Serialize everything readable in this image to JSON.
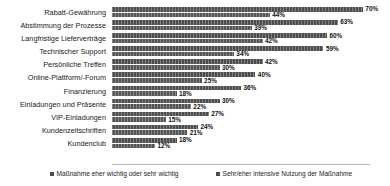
{
  "chart_data": {
    "type": "bar",
    "orientation": "horizontal",
    "title": "",
    "xlabel": "",
    "ylabel": "",
    "xlim": [
      0,
      72
    ],
    "grid": false,
    "legend_position": "bottom",
    "categories": [
      "Rabatt-Gewährung",
      "Abstimmung der Prozesse",
      "Langfristige Lieferverträge",
      "Technischer Support",
      "Persönliche Treffen",
      "Online-Plattform/-Forum",
      "Finanzierung",
      "Einladungen und Präsente",
      "VIP-Einladungen",
      "Kundenzeitschriften",
      "Kundenclub"
    ],
    "series": [
      {
        "name": "Maßnahme eher wichtig oder sehr wichtig",
        "color": "#4d4d4d",
        "values": [
          70,
          63,
          60,
          59,
          42,
          40,
          36,
          30,
          27,
          24,
          18
        ],
        "labels": [
          "70%",
          "63%",
          "60%",
          "59%",
          "42%",
          "40%",
          "36%",
          "30%",
          "27%",
          "24%",
          "18%"
        ]
      },
      {
        "name": "Sehr/eher intensive Nutzung der Maßnahme",
        "color": "#555555",
        "values": [
          44,
          39,
          42,
          34,
          30,
          25,
          18,
          22,
          15,
          21,
          12
        ],
        "labels": [
          "44%",
          "39%",
          "42%",
          "34%",
          "30%",
          "25%",
          "18%",
          "22%",
          "15%",
          "21%",
          "12%"
        ]
      }
    ]
  }
}
